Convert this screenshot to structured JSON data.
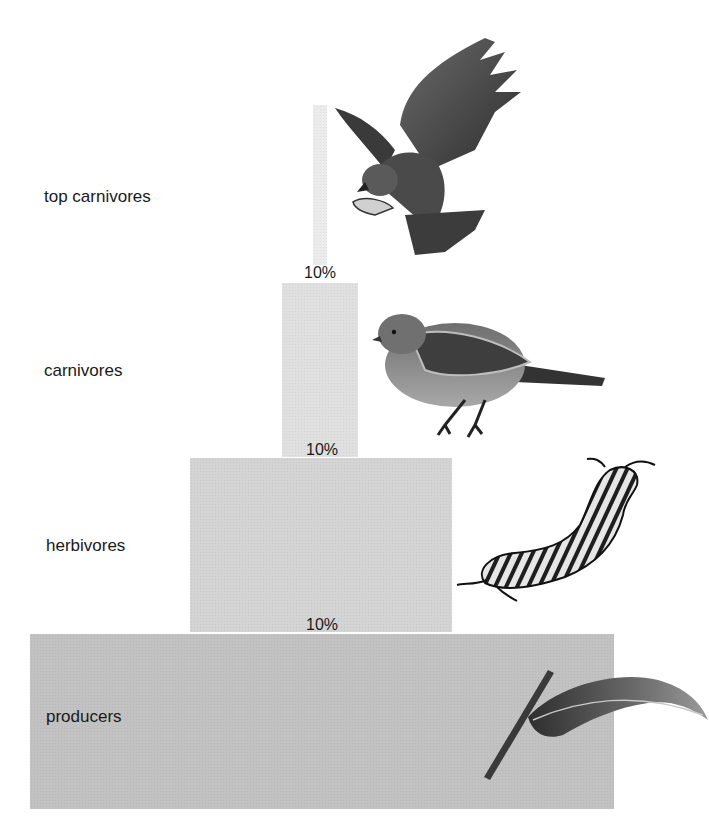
{
  "pyramid": {
    "levels": [
      {
        "label": "top carnivores",
        "icon": "hawk-icon"
      },
      {
        "label": "carnivores",
        "icon": "sparrow-icon"
      },
      {
        "label": "herbivores",
        "icon": "caterpillar-icon"
      },
      {
        "label": "producers",
        "icon": "leaf-icon"
      }
    ],
    "transfers": [
      {
        "value": "10%"
      },
      {
        "value": "10%"
      },
      {
        "value": "10%"
      }
    ]
  },
  "colors": {
    "top_carnivores_bar": "#ececec",
    "carnivores_bar": "#e0e0e0",
    "herbivores_bar": "#d4d4d4",
    "producers_bar": "#c2c2c2",
    "text": "#1a1a1a"
  }
}
